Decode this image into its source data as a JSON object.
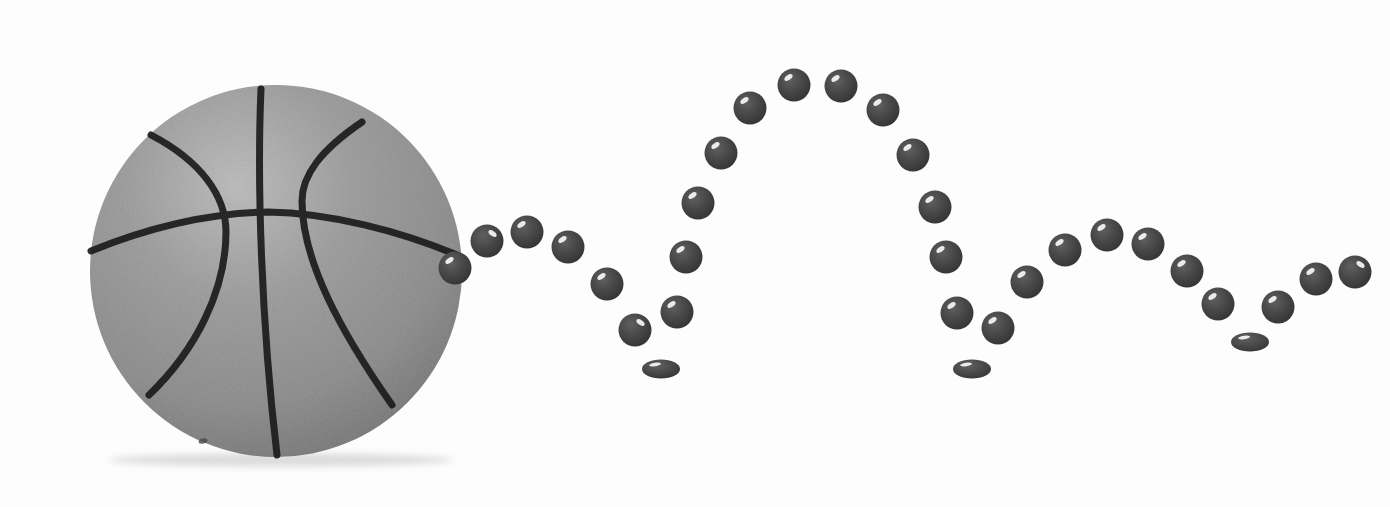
{
  "scene": {
    "width": 1390,
    "height": 507,
    "background_color": "#fdfdfd",
    "description": "Stroboscopic diagram of a basketball bouncing: large basketball at left, dotted trajectory with three floor contacts moving right"
  },
  "basketball": {
    "cx": 276,
    "cy": 271,
    "r": 186,
    "light_color": "#bababa",
    "mid_color": "#9a9a9a",
    "base_color": "#8a8a8a",
    "edge_color": "#6d6d6d",
    "seam_color": "#1c1c1c",
    "shadow_color": "#bfbfbf",
    "blemish_color": "#4a4a4a"
  },
  "trajectory": {
    "marker_light_color": "#606060",
    "marker_color": "#474747",
    "marker_dark_color": "#2d2d2d",
    "highlight_color": "#ffffff",
    "round_radius": 16.5,
    "squashed_rx": 19,
    "squashed_ry": 9.5,
    "bounce_count": 3,
    "markers": [
      {
        "x": 455,
        "y": 268,
        "shape": "round",
        "hl": "tl"
      },
      {
        "x": 487,
        "y": 241,
        "shape": "round",
        "hl": "tr"
      },
      {
        "x": 527,
        "y": 232,
        "shape": "round",
        "hl": "tl"
      },
      {
        "x": 568,
        "y": 247,
        "shape": "round",
        "hl": "tl"
      },
      {
        "x": 607,
        "y": 284,
        "shape": "round",
        "hl": "tl"
      },
      {
        "x": 635,
        "y": 330,
        "shape": "round",
        "hl": "tr"
      },
      {
        "x": 661,
        "y": 369,
        "shape": "squashed",
        "hl": "tl"
      },
      {
        "x": 677,
        "y": 312,
        "shape": "round",
        "hl": "tl"
      },
      {
        "x": 686,
        "y": 257,
        "shape": "round",
        "hl": "tl"
      },
      {
        "x": 698,
        "y": 203,
        "shape": "round",
        "hl": "tl"
      },
      {
        "x": 721,
        "y": 153,
        "shape": "round",
        "hl": "tl"
      },
      {
        "x": 750,
        "y": 108,
        "shape": "round",
        "hl": "tl"
      },
      {
        "x": 794,
        "y": 85,
        "shape": "round",
        "hl": "tl"
      },
      {
        "x": 841,
        "y": 86,
        "shape": "round",
        "hl": "tl"
      },
      {
        "x": 883,
        "y": 110,
        "shape": "round",
        "hl": "tl"
      },
      {
        "x": 913,
        "y": 155,
        "shape": "round",
        "hl": "tl"
      },
      {
        "x": 935,
        "y": 207,
        "shape": "round",
        "hl": "tl"
      },
      {
        "x": 946,
        "y": 257,
        "shape": "round",
        "hl": "tl"
      },
      {
        "x": 957,
        "y": 313,
        "shape": "round",
        "hl": "tl"
      },
      {
        "x": 972,
        "y": 369,
        "shape": "squashed",
        "hl": "tl"
      },
      {
        "x": 998,
        "y": 328,
        "shape": "round",
        "hl": "tl"
      },
      {
        "x": 1027,
        "y": 282,
        "shape": "round",
        "hl": "tl"
      },
      {
        "x": 1065,
        "y": 250,
        "shape": "round",
        "hl": "tl"
      },
      {
        "x": 1107,
        "y": 235,
        "shape": "round",
        "hl": "tl"
      },
      {
        "x": 1148,
        "y": 244,
        "shape": "round",
        "hl": "tl"
      },
      {
        "x": 1187,
        "y": 271,
        "shape": "round",
        "hl": "tl"
      },
      {
        "x": 1218,
        "y": 304,
        "shape": "round",
        "hl": "tl"
      },
      {
        "x": 1250,
        "y": 342,
        "shape": "squashed",
        "hl": "tl"
      },
      {
        "x": 1278,
        "y": 307,
        "shape": "round",
        "hl": "tl"
      },
      {
        "x": 1316,
        "y": 279,
        "shape": "round",
        "hl": "tl"
      },
      {
        "x": 1355,
        "y": 272,
        "shape": "round",
        "hl": "tr"
      }
    ]
  }
}
